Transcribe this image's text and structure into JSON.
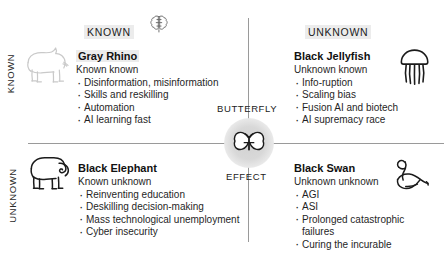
{
  "axes": {
    "row_known": "KNOWN",
    "row_unknown": "UNKNOWN",
    "col_known": "KNOWN",
    "col_unknown": "UNKNOWN"
  },
  "centre": {
    "word_top": "BUTTERFLY",
    "word_bottom": "EFFECT",
    "icon": "butterfly-icon"
  },
  "top_icon": {
    "name": "brain-icon"
  },
  "quadrants": {
    "gray_rhino": {
      "title": "Gray Rhino",
      "subtitle": "Known known",
      "icon": "rhino-icon",
      "items": [
        "Disinformation, misinformation",
        "Skills and reskilling",
        "Automation",
        "AI learning fast"
      ]
    },
    "black_jellyfish": {
      "title": "Black Jellyfish",
      "subtitle": "Unknown known",
      "icon": "jellyfish-icon",
      "items": [
        "Info-ruption",
        "Scaling bias",
        "Fusion AI and biotech",
        "AI supremacy race"
      ]
    },
    "black_elephant": {
      "title": "Black Elephant",
      "subtitle": "Known unknown",
      "icon": "elephant-icon",
      "items": [
        "Reinventing education",
        "Deskilling decision-making",
        "Mass technological unemployment",
        "Cyber insecurity"
      ]
    },
    "black_swan": {
      "title": "Black Swan",
      "subtitle": "Unknown unknown",
      "icon": "swan-icon",
      "items": [
        "AGI",
        "ASI",
        "Prolonged catastrophic failures",
        "Curing the incurable"
      ]
    }
  },
  "colors": {
    "line": "#9a9a9a",
    "highlight": "#ececec",
    "text": "#1f1f1f",
    "node": "#d2d2d2"
  }
}
